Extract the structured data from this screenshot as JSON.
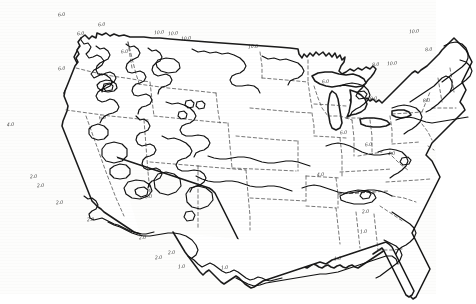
{
  "figure": {
    "kind": "contour-map",
    "region": "Continental United States",
    "title_partial": "",
    "background_color": "#fdfdfc",
    "line_color": "#1a1a1a",
    "state_border_color": "#3d3d3d",
    "contour_color": "#111111"
  },
  "chart_data": {
    "type": "contour-map",
    "title": "",
    "subtitle": "",
    "xlabel": "",
    "ylabel": "",
    "projection": "conic (approximate)",
    "grid": false,
    "legend": "none",
    "contour_interval": 2.0,
    "contour_levels": [
      1.0,
      2.0,
      4.0,
      6.0,
      8.0,
      10.0
    ],
    "value_range": [
      1.0,
      10.0
    ],
    "base_map": {
      "outline": "United States national coastline and borders",
      "internal_boundaries": "state boundaries, dashed"
    },
    "labels": [
      {
        "text": "6.0",
        "x": 63,
        "y": 14,
        "rotate": -8,
        "region": "northern Washington"
      },
      {
        "text": "6.0",
        "x": 82,
        "y": 33,
        "rotate": -6,
        "region": "northeast Washington"
      },
      {
        "text": "6.0",
        "x": 103,
        "y": 24,
        "rotate": -5,
        "region": "northern Idaho"
      },
      {
        "text": "10.0",
        "x": 159,
        "y": 32,
        "rotate": -4,
        "region": "northern Montana"
      },
      {
        "text": "10.0",
        "x": 173,
        "y": 33,
        "rotate": -4,
        "region": "north-central Montana"
      },
      {
        "text": "10.0",
        "x": 186,
        "y": 38,
        "rotate": -4,
        "region": "northeast Montana"
      },
      {
        "text": "10.0",
        "x": 253,
        "y": 46,
        "rotate": -3,
        "region": "northern North Dakota"
      },
      {
        "text": "6.0",
        "x": 126,
        "y": 51,
        "rotate": -3,
        "region": "central Montana"
      },
      {
        "text": "6.0",
        "x": 63,
        "y": 68,
        "rotate": -4,
        "region": "central Washington"
      },
      {
        "text": "8.0",
        "x": 377,
        "y": 64,
        "rotate": -4,
        "region": "northern New York"
      },
      {
        "text": "10.0",
        "x": 392,
        "y": 63,
        "rotate": -4,
        "region": "northern Vermont"
      },
      {
        "text": "10.0",
        "x": 414,
        "y": 31,
        "rotate": -4,
        "region": "northern Maine"
      },
      {
        "text": "8.0",
        "x": 430,
        "y": 49,
        "rotate": -4,
        "region": "eastern Maine"
      },
      {
        "text": "6.0",
        "x": 327,
        "y": 81,
        "rotate": -3,
        "region": "northern Michigan"
      },
      {
        "text": "8.0",
        "x": 375,
        "y": 98,
        "rotate": -3,
        "region": "central New York"
      },
      {
        "text": "8.0",
        "x": 428,
        "y": 100,
        "rotate": -3,
        "region": "coastal New England"
      },
      {
        "text": "4.0",
        "x": 12,
        "y": 124,
        "rotate": -3,
        "region": "northern California coast"
      },
      {
        "text": "6.0",
        "x": 104,
        "y": 117,
        "rotate": -3,
        "region": "southern Idaho"
      },
      {
        "text": "6.0",
        "x": 345,
        "y": 132,
        "rotate": -3,
        "region": "West Virginia"
      },
      {
        "text": "6.0",
        "x": 370,
        "y": 144,
        "rotate": -3,
        "region": "central Virginia"
      },
      {
        "text": "4.0",
        "x": 393,
        "y": 153,
        "rotate": -3,
        "region": "eastern Virginia"
      },
      {
        "text": "4.0",
        "x": 322,
        "y": 174,
        "rotate": -3,
        "region": "Tennessee"
      },
      {
        "text": "2.0",
        "x": 35,
        "y": 176,
        "rotate": -3,
        "region": "southern California"
      },
      {
        "text": "2.0",
        "x": 42,
        "y": 185,
        "rotate": -3,
        "region": "southern California coast"
      },
      {
        "text": "2.0",
        "x": 61,
        "y": 202,
        "rotate": -3,
        "region": "southern California border"
      },
      {
        "text": "6.0",
        "x": 150,
        "y": 196,
        "rotate": -3,
        "region": "central Arizona"
      },
      {
        "text": "2.0",
        "x": 92,
        "y": 219,
        "rotate": -3,
        "region": "southern Arizona"
      },
      {
        "text": "2.0",
        "x": 144,
        "y": 237,
        "rotate": -3,
        "region": "west Texas"
      },
      {
        "text": "2.0",
        "x": 160,
        "y": 257,
        "rotate": -3,
        "region": "southwest Texas"
      },
      {
        "text": "2.0",
        "x": 173,
        "y": 252,
        "rotate": -3,
        "region": "south Texas"
      },
      {
        "text": "1.0",
        "x": 183,
        "y": 266,
        "rotate": -3,
        "region": "south Texas coast"
      },
      {
        "text": "1.0",
        "x": 226,
        "y": 267,
        "rotate": -3,
        "region": "Texas Gulf coast"
      },
      {
        "text": "2.0",
        "x": 367,
        "y": 211,
        "rotate": -3,
        "region": "South Carolina"
      },
      {
        "text": "1.0",
        "x": 365,
        "y": 231,
        "rotate": -3,
        "region": "Georgia coast"
      },
      {
        "text": "1.0",
        "x": 339,
        "y": 258,
        "rotate": -3,
        "region": "northern Florida"
      }
    ]
  }
}
